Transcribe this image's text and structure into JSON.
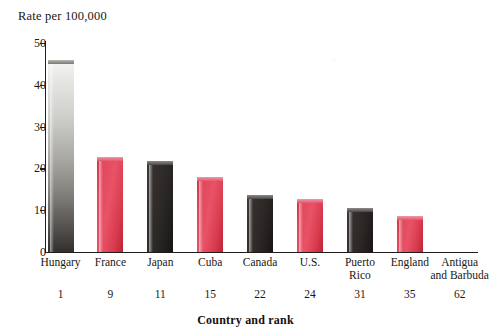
{
  "chart_data": {
    "type": "bar",
    "title": "",
    "ylabel": "Rate per 100,000",
    "xlabel": "Country and rank",
    "ylim": [
      0,
      50
    ],
    "yticks": [
      0,
      10,
      20,
      30,
      40,
      50
    ],
    "grid": false,
    "legend": null,
    "categories": [
      "Hungary",
      "France",
      "Japan",
      "Cuba",
      "Canada",
      "U.S.",
      "Puerto Rico",
      "England",
      "Antigua and Barbuda"
    ],
    "category_lines": [
      [
        "Hungary"
      ],
      [
        "France"
      ],
      [
        "Japan"
      ],
      [
        "Cuba"
      ],
      [
        "Canada"
      ],
      [
        "U.S."
      ],
      [
        "Puerto",
        "Rico"
      ],
      [
        "England"
      ],
      [
        "Antigua",
        "and Barbuda"
      ]
    ],
    "ranks": [
      "1",
      "9",
      "11",
      "15",
      "22",
      "24",
      "31",
      "35",
      "62"
    ],
    "values": [
      45,
      22,
      21,
      17,
      12.7,
      11.8,
      9.8,
      7.8,
      0
    ],
    "bar_styles": [
      "silver",
      "red",
      "dark",
      "red",
      "dark",
      "red",
      "dark",
      "red",
      "none"
    ]
  },
  "colors": {
    "red": "#e2485c",
    "red_dark": "#bb2336",
    "dark": "#2c2826",
    "silver_light": "#f2f2f0",
    "silver_dark": "#332f2d",
    "axis": "#221d1a",
    "text": "#1a1714",
    "background": "#ffffff"
  }
}
